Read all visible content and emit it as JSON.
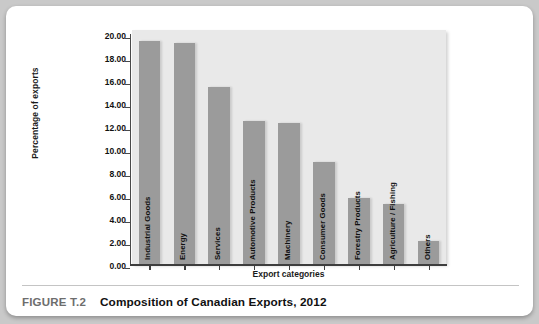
{
  "figure": {
    "number": "FIGURE T.2",
    "title": "Composition of Canadian Exports, 2012"
  },
  "chart_data": {
    "type": "bar",
    "title": "Composition of Canadian Exports, 2012",
    "xlabel": "Export categories",
    "ylabel": "Percentage of exports",
    "ylim": [
      0,
      20
    ],
    "ytick_step": 2,
    "ytick_labels": [
      "0.00",
      "2.00",
      "4.00",
      "6.00",
      "8.00",
      "10.00",
      "12.00",
      "14.00",
      "16.00",
      "18.00",
      "20.00"
    ],
    "grid": false,
    "legend": null,
    "bar_color": "#9b9b9b",
    "plot_background": "#e9e9e9",
    "categories": [
      "Industrial Goods",
      "Energy",
      "Services",
      "Automotive Products",
      "Machinery",
      "Consumer Goods",
      "Forestry Products",
      "Agriculture / Fishing",
      "Others"
    ],
    "values": [
      19.4,
      19.2,
      15.4,
      12.4,
      12.3,
      8.9,
      5.7,
      5.2,
      2.0
    ]
  }
}
